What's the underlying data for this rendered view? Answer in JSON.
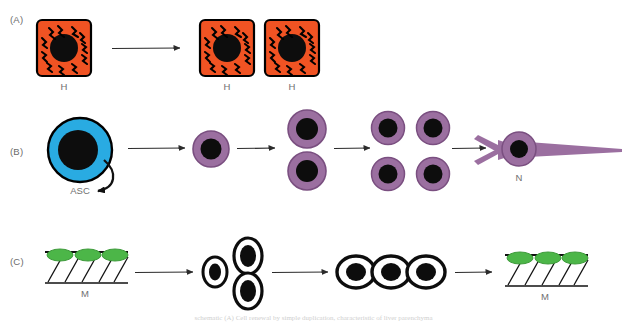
{
  "figure": {
    "width": 627,
    "height": 322,
    "background": "#ffffff",
    "bottom_caption": "schematic (A) Cell renewal by simple duplication, characteristic of liver parenchyma"
  },
  "colors": {
    "hepatocyte_fill": "#F05323",
    "hepatocyte_stroke": "#000000",
    "nucleus": "#0d0d0d",
    "asc_fill": "#29ABE2",
    "asc_stroke": "#000000",
    "progenitor_fill": "#9B6FA0",
    "progenitor_stroke": "#7A4F80",
    "neuron_fill": "#9B6FA0",
    "satellite_green": "#4CB648",
    "satellite_green_stroke": "#3D9A3A",
    "muscle_line": "#111111",
    "arrow": "#2b2b2b",
    "label_text": "#6f6f6f"
  },
  "panels": [
    {
      "id": "panel-a",
      "label": "(A)",
      "label_x": 10,
      "label_y": 20,
      "description": "Hepatocyte duplication",
      "cells": [
        {
          "name": "hepatocyte-source",
          "label": "H",
          "cx": 64,
          "cy": 48
        },
        {
          "name": "hepatocyte-daughter-1",
          "label": "H",
          "cx": 227,
          "cy": 48
        },
        {
          "name": "hepatocyte-daughter-2",
          "label": "H",
          "cx": 292,
          "cy": 48
        }
      ],
      "arrows": [
        {
          "name": "arrow-a-1",
          "x1": 112,
          "x2": 184,
          "y": 48
        }
      ]
    },
    {
      "id": "panel-b",
      "label": "(B)",
      "label_x": 10,
      "label_y": 152,
      "description": "Adult stem cell self-renewal and neuronal differentiation",
      "cells": [
        {
          "name": "adult-stem-cell",
          "label": "ASC",
          "cx": 80,
          "cy": 150
        },
        {
          "name": "progenitor-1",
          "label": "",
          "cx": 211,
          "cy": 150
        },
        {
          "name": "progenitor-2",
          "label": "",
          "cx": 307,
          "cy": 133
        },
        {
          "name": "progenitor-3",
          "label": "",
          "cx": 307,
          "cy": 170
        },
        {
          "name": "progenitor-4",
          "label": "",
          "cx": 387,
          "cy": 130
        },
        {
          "name": "progenitor-5",
          "label": "",
          "cx": 432,
          "cy": 130
        },
        {
          "name": "progenitor-6",
          "label": "",
          "cx": 387,
          "cy": 172
        },
        {
          "name": "progenitor-7",
          "label": "",
          "cx": 432,
          "cy": 172
        },
        {
          "name": "neuron",
          "label": "N",
          "cx": 518,
          "cy": 150
        }
      ],
      "arrows": [
        {
          "name": "arrow-b-1",
          "x1": 130,
          "x2": 188,
          "y": 148
        },
        {
          "name": "arrow-b-2",
          "x1": 238,
          "x2": 278,
          "y": 148
        },
        {
          "name": "arrow-b-3",
          "x1": 335,
          "x2": 372,
          "y": 148
        },
        {
          "name": "arrow-b-4",
          "x1": 450,
          "x2": 487,
          "y": 148
        }
      ],
      "self_renewal_arrow": {
        "name": "self-renewal-arrow",
        "label": "ASC"
      }
    },
    {
      "id": "panel-c",
      "label": "(C)",
      "label_x": 10,
      "label_y": 262,
      "description": "Satellite cell activation, myoblast fusion and muscle fiber regeneration",
      "cells": [
        {
          "name": "muscle-fiber-source",
          "label": "M",
          "cx": 85,
          "cy": 265
        },
        {
          "name": "myoblast-1",
          "label": "",
          "cx": 215,
          "cy": 272
        },
        {
          "name": "myoblast-2",
          "label": "",
          "cx": 248,
          "cy": 257
        },
        {
          "name": "myoblast-3",
          "label": "",
          "cx": 248,
          "cy": 290
        },
        {
          "name": "myotube-1",
          "label": "",
          "cx": 355,
          "cy": 272
        },
        {
          "name": "myotube-2",
          "label": "",
          "cx": 390,
          "cy": 272
        },
        {
          "name": "myotube-3",
          "label": "",
          "cx": 425,
          "cy": 272
        },
        {
          "name": "muscle-fiber-result",
          "label": "M",
          "cx": 530,
          "cy": 265
        }
      ],
      "arrows": [
        {
          "name": "arrow-c-1",
          "x1": 135,
          "x2": 195,
          "y": 272
        },
        {
          "name": "arrow-c-2",
          "x1": 270,
          "x2": 330,
          "y": 272
        },
        {
          "name": "arrow-c-3",
          "x1": 455,
          "x2": 493,
          "y": 272
        }
      ]
    }
  ],
  "labels": {
    "panel_a": "(A)",
    "panel_b": "(B)",
    "panel_c": "(C)",
    "hepatocyte_1": "H",
    "hepatocyte_2": "H",
    "hepatocyte_3": "H",
    "asc": "ASC",
    "neuron": "N",
    "muscle_source": "M",
    "muscle_result": "M"
  }
}
